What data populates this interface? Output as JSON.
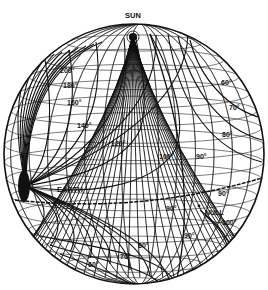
{
  "diagram": {
    "type": "celestial-sphere-scattering-angle-contours",
    "sphere": {
      "cx": 134,
      "cy": 154,
      "r": 130
    },
    "colors": {
      "ink": "#111111",
      "grid": "#222222",
      "background": "#ffffff"
    },
    "poles": {
      "sun": {
        "label": "SUN",
        "x": 133,
        "y": 36
      },
      "earth": {
        "label": "EARTH",
        "x": 26,
        "y": 186
      },
      "null": {
        "label": "NULL",
        "x": 201,
        "y": 209
      }
    },
    "contour_labels": [
      {
        "id": "c200",
        "text": "200°",
        "x": 60,
        "y": 73
      },
      {
        "id": "c180",
        "text": "180°",
        "x": 63,
        "y": 88
      },
      {
        "id": "c160",
        "text": "160°",
        "x": 67,
        "y": 105
      },
      {
        "id": "c140",
        "text": "140°",
        "x": 77,
        "y": 128
      },
      {
        "id": "c120",
        "text": "120°",
        "x": 111,
        "y": 146
      },
      {
        "id": "c100",
        "text": "100°",
        "x": 159,
        "y": 159
      },
      {
        "id": "c90a",
        "text": "90°",
        "x": 196,
        "y": 159
      },
      {
        "id": "c60r",
        "text": "60°",
        "x": 221,
        "y": 85
      },
      {
        "id": "c70r",
        "text": "70°",
        "x": 229,
        "y": 110
      },
      {
        "id": "c80r",
        "text": "80°",
        "x": 222,
        "y": 137
      },
      {
        "id": "c90b",
        "text": "90°",
        "x": 218,
        "y": 196
      },
      {
        "id": "c90c",
        "text": "90°",
        "x": 166,
        "y": 211
      },
      {
        "id": "c100b",
        "text": "100°",
        "x": 222,
        "y": 225
      },
      {
        "id": "c90d",
        "text": "90°",
        "x": 184,
        "y": 238
      },
      {
        "id": "c80b",
        "text": "80°",
        "x": 138,
        "y": 248
      },
      {
        "id": "c70b",
        "text": "70°",
        "x": 120,
        "y": 259
      },
      {
        "id": "c60b",
        "text": "60°",
        "x": 88,
        "y": 267
      }
    ]
  }
}
